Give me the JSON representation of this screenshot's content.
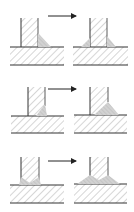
{
  "diagram": {
    "title": "",
    "colors": {
      "background": "#ffffff",
      "outline": "#333333",
      "hatch": "#8a8a8a",
      "weld_fill": "#c8c8c8",
      "arrow": "#222222"
    },
    "rows": [
      {
        "label": "row-1",
        "before": {
          "weld": "single-fillet-right"
        },
        "after": {
          "weld": "double-fillet-small"
        },
        "arrow_icon": "arrow-right-icon"
      },
      {
        "label": "row-2",
        "before": {
          "weld": "partial-bevel-right"
        },
        "after": {
          "weld": "large-fillet-right"
        },
        "arrow_icon": "arrow-right-icon"
      },
      {
        "label": "row-3",
        "before": {
          "weld": "v-groove-small"
        },
        "after": {
          "weld": "v-groove-with-fillets"
        },
        "arrow_icon": "arrow-right-icon"
      }
    ]
  }
}
